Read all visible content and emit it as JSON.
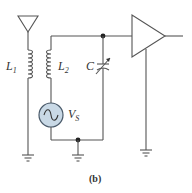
{
  "figure": {
    "caption": "(b)",
    "colors": {
      "wire": "#555555",
      "source_fill": "#c9d9e6",
      "source_stroke": "#4a5a6a",
      "text": "#333333"
    },
    "components": {
      "antenna": {
        "label": ""
      },
      "inductor_1": {
        "label_main": "L",
        "label_sub": "1"
      },
      "inductor_2": {
        "label_main": "L",
        "label_sub": "2"
      },
      "variable_capacitor": {
        "label": "C"
      },
      "voltage_source": {
        "label_main": "V",
        "label_sub": "S"
      },
      "amplifier": {
        "label": ""
      },
      "grounds": 4,
      "junction_dots": 2
    }
  }
}
